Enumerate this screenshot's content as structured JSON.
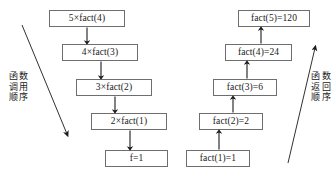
{
  "diagram": {
    "title_caption": "",
    "stroke_color": "#6e6e6e",
    "text_color": "#1a1a1a",
    "background": "#ffffff",
    "call_column": {
      "label_lines": [
        "函",
        "数",
        "调",
        "用",
        "顺",
        "序"
      ],
      "label_col1": [
        "函",
        "调",
        "顺"
      ],
      "label_col2": [
        "数",
        "用",
        "序"
      ],
      "nodes": [
        {
          "text": "5×fact(4)"
        },
        {
          "text": "4×fact(3)"
        },
        {
          "text": "3×fact(2)"
        },
        {
          "text": "2×fact(1)"
        },
        {
          "text": "f=1"
        }
      ]
    },
    "return_column": {
      "label_col1": [
        "函",
        "返",
        "顺"
      ],
      "label_col2": [
        "数",
        "回",
        "序"
      ],
      "nodes": [
        {
          "text": "fact(5)=120"
        },
        {
          "text": "fact(4)=24"
        },
        {
          "text": "fact(3)=6"
        },
        {
          "text": "fact(2)=2"
        },
        {
          "text": "fact(1)=1"
        }
      ]
    }
  }
}
